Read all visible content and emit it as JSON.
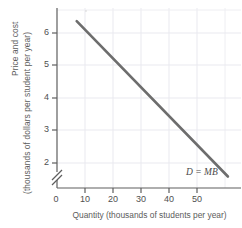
{
  "chart_data": {
    "type": "line",
    "title": "",
    "subtitle": "",
    "xlabel": "Quantity (thousands of students per year)",
    "ylabel_title": "Price and cost",
    "ylabel_units": "(thousands of dollars per student per year)",
    "xlim": [
      0,
      56
    ],
    "ylim": [
      1.4,
      6.9
    ],
    "y_axis_break": true,
    "y_axis_break_note": "axis broken between 0 and 2",
    "xticks": [
      0,
      10,
      20,
      30,
      40,
      50
    ],
    "xtick_labels": [
      "0",
      "10",
      "20",
      "30",
      "40",
      "50"
    ],
    "yticks": [
      2,
      3,
      4,
      5,
      6
    ],
    "ytick_labels": [
      "2",
      "3",
      "4",
      "5",
      "6"
    ],
    "y_origin_label": "0",
    "grid": true,
    "grid_color": "#e8e8ee",
    "legend_position": "inline-right-end",
    "series": [
      {
        "name": "D = MB",
        "label": "D = MB",
        "color": "#6d6d6d",
        "linewidth": 2.6,
        "points": [
          {
            "x": 6,
            "y": 6.5
          },
          {
            "x": 52,
            "y": 1.75
          }
        ]
      }
    ],
    "annotations": [
      {
        "text": "D = MB",
        "x": 47,
        "y": 1.55
      }
    ]
  },
  "axes": {
    "x_title": "Quantity (thousands of students per year)",
    "y_title_line1": "Price and cost",
    "y_title_line2": "(thousands of dollars per student per year)"
  },
  "ticks": {
    "x": [
      "0",
      "10",
      "20",
      "30",
      "40",
      "50"
    ],
    "y": [
      "6",
      "5",
      "4",
      "3",
      "2"
    ],
    "y_zero": "0"
  },
  "curve": {
    "label": "D = MB"
  },
  "colors": {
    "curve": "#6d6d6d",
    "axis": "#5e5e5e",
    "grid": "#e8e8ee",
    "text": "#4f4f4f",
    "background": "#ffffff"
  }
}
